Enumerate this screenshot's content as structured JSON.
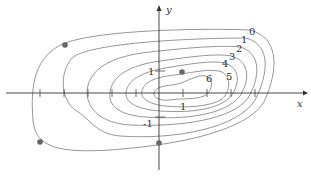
{
  "diagram": {
    "type": "contour_map",
    "axes": {
      "x_label": "x",
      "y_label": "y",
      "y_tick_labels": [
        "1",
        "-1"
      ],
      "x_tick_labels": [
        "1"
      ]
    },
    "contour_levels": [
      "0",
      "1",
      "2",
      "3",
      "4",
      "5",
      "6"
    ],
    "points_marked": 4,
    "colors": {
      "contour": "#8a8a8a",
      "axis": "#333333",
      "point": "#666666"
    }
  }
}
